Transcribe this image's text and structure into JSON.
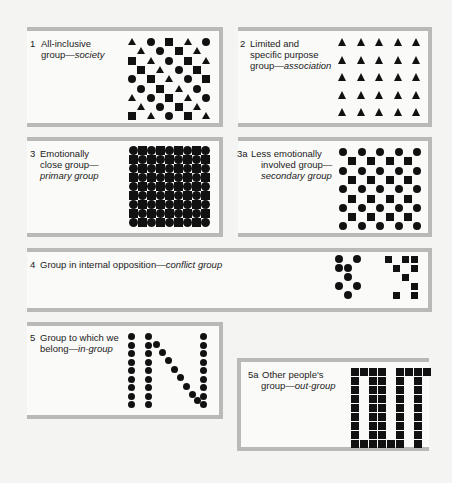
{
  "panels": [
    {
      "id": "1",
      "number": "1",
      "line1": "All-inclusive",
      "line2_plain": "group—",
      "line2_italic": "society",
      "line3_plain": "",
      "line3_italic": "",
      "pattern": "mixed triangles, squares and circles in diagonal arrangement"
    },
    {
      "id": "2",
      "number": "2",
      "line1": "Limited and",
      "line2_plain": "specific purpose",
      "line2_italic": "",
      "line3_plain": "group—",
      "line3_italic": "association",
      "pattern": "5x5 grid of triangles"
    },
    {
      "id": "3",
      "number": "3",
      "line1": "Emotionally",
      "line2_plain": "close group—",
      "line2_italic": "",
      "line3_plain": "",
      "line3_italic": "primary group",
      "pattern": "dense 9x9 alternating circles and squares"
    },
    {
      "id": "3a",
      "number": "3a",
      "line1": "Less emotionally",
      "line2_plain": "involved group—",
      "line2_italic": "",
      "line3_plain": "",
      "line3_italic": "secondary group",
      "pattern": "checkerboard of circles and squares spaced apart"
    },
    {
      "id": "4",
      "number": "4",
      "line1_plain": "Group in internal opposition—",
      "line1_italic": "conflict group",
      "pattern": "cluster of circles opposing cluster of squares"
    },
    {
      "id": "5",
      "number": "5",
      "line1": "Group to which we",
      "line2_plain": "belong—",
      "line2_italic": "in-group",
      "pattern": "dots spelling IN"
    },
    {
      "id": "5a",
      "number": "5a",
      "line1": "Other people's",
      "line2_plain": "group—",
      "line2_italic": "out-group",
      "pattern": "squares spelling OUT"
    }
  ],
  "colors": {
    "background": "#f4f4f2",
    "frame": "#b9b9b7",
    "panel": "#fafaf8",
    "ink": "#111111"
  }
}
